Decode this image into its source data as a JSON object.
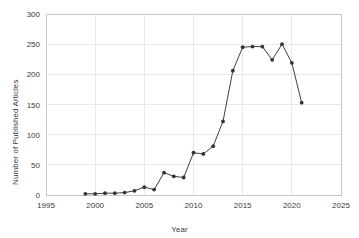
{
  "chart_data": {
    "type": "line",
    "title": "",
    "xlabel": "Year",
    "ylabel": "Number of Published Articles",
    "xlim": [
      1995,
      2025
    ],
    "ylim": [
      0,
      300
    ],
    "xticks": [
      1995,
      2000,
      2005,
      2010,
      2015,
      2020,
      2025
    ],
    "yticks": [
      0,
      50,
      100,
      150,
      200,
      250,
      300
    ],
    "grid": true,
    "legend": "none",
    "marker": "circle",
    "line_color": "#3f3f3f",
    "marker_color": "#333333",
    "grid_color": "#e8e8e8",
    "x": [
      1999,
      2000,
      2001,
      2002,
      2003,
      2004,
      2005,
      2006,
      2007,
      2008,
      2009,
      2010,
      2011,
      2012,
      2013,
      2014,
      2015,
      2016,
      2017,
      2018,
      2019,
      2020,
      2021
    ],
    "values": [
      2,
      2,
      3,
      3,
      4,
      7,
      13,
      9,
      37,
      31,
      29,
      70,
      68,
      81,
      122,
      206,
      245,
      246,
      246,
      224,
      250,
      219,
      153
    ],
    "series": [
      {
        "name": "Published Articles",
        "values": [
          2,
          2,
          3,
          3,
          4,
          7,
          13,
          9,
          37,
          31,
          29,
          70,
          68,
          81,
          122,
          206,
          245,
          246,
          246,
          224,
          250,
          219,
          153
        ]
      }
    ]
  }
}
